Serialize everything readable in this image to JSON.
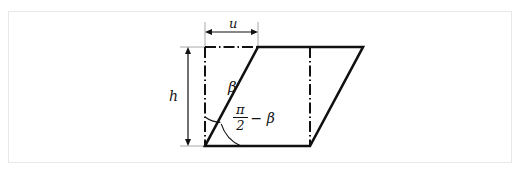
{
  "figure": {
    "background_color": "#ffffff",
    "frame_color": "#e8e8e8",
    "stroke_color": "#111111",
    "dimension_line_color": "#8a8a8a",
    "labels": {
      "u": "u",
      "h": "h",
      "beta": "β",
      "pi": "π",
      "two": "2",
      "minus_beta": "− β"
    },
    "annotations": {
      "width_label": "u",
      "height_label": "h",
      "upper_angle_label": "β",
      "lower_angle_label": "π/2 − β"
    },
    "geometry": {
      "bottom_left": [
        205,
        146
      ],
      "bottom_right": [
        310,
        146
      ],
      "top_right": [
        363,
        47
      ],
      "top_left": [
        258,
        47
      ],
      "shear_offset_u": 53,
      "height_h": 99,
      "base_length": 105,
      "centerline_x": 310
    }
  }
}
